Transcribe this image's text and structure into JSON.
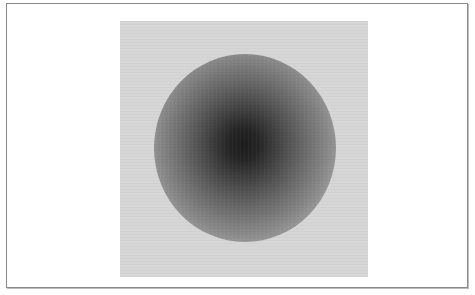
{
  "figure": {
    "background_color": "#d6d6d6",
    "core_color": "#1c1c1c",
    "frame_border_color": "#8a8a8a",
    "caption": ""
  }
}
